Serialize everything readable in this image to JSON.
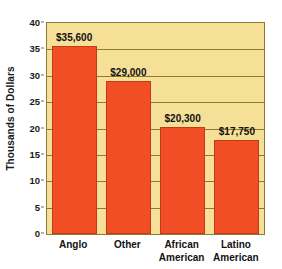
{
  "chart_data": {
    "type": "bar",
    "title": "",
    "xlabel": "",
    "ylabel": "Thousands of Dollars",
    "categories": [
      "Anglo",
      "Other",
      "African American",
      "Latino American"
    ],
    "category_lines": [
      [
        "Anglo"
      ],
      [
        "Other"
      ],
      [
        "African",
        "American"
      ],
      [
        "Latino",
        "American"
      ]
    ],
    "values": [
      35.6,
      29.0,
      20.3,
      17.75
    ],
    "data_labels": [
      "$35,600",
      "$29,000",
      "$20,300",
      "$17,750"
    ],
    "ylim": [
      0,
      40
    ],
    "yticks": [
      0,
      5,
      10,
      15,
      20,
      25,
      30,
      35,
      40
    ],
    "ytick_labels": [
      "0",
      "5",
      "10",
      "15",
      "20",
      "25",
      "30",
      "35",
      "40"
    ],
    "grid": true,
    "legend": "none",
    "colors": {
      "bar": "#f24e25",
      "bar_edge": "#c33a18",
      "plot_background": "#f6df97",
      "gridline": "#8a7a35",
      "text": "#111111",
      "page_background": "#ffffff"
    }
  }
}
